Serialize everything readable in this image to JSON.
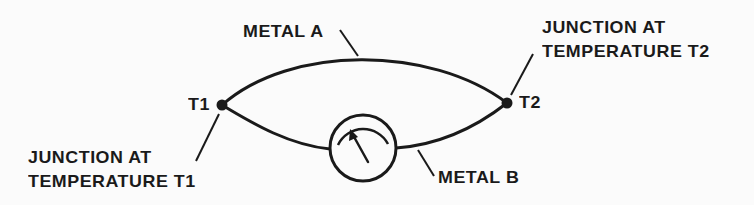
{
  "diagram": {
    "type": "thermocouple-circuit",
    "stroke_color": "#1a1a1a",
    "background_color": "#fbfbfb",
    "labels": {
      "metal_a": "METAL A",
      "metal_b": "METAL B",
      "t1": "T1",
      "t2": "T2",
      "junction_t1": {
        "line1": "JUNCTION AT",
        "line2": "TEMPERATURE T1"
      },
      "junction_t2": {
        "line1": "JUNCTION AT",
        "line2": "TEMPERATURE T2"
      }
    },
    "nodes": [
      {
        "id": "junction-t1",
        "label": "T1"
      },
      {
        "id": "junction-t2",
        "label": "T2"
      },
      {
        "id": "meter",
        "label": "galvanometer"
      }
    ],
    "edges": [
      {
        "from": "junction-t1",
        "to": "junction-t2",
        "label": "METAL A"
      },
      {
        "from": "junction-t1",
        "to": "meter",
        "label": "METAL B"
      },
      {
        "from": "meter",
        "to": "junction-t2",
        "label": "METAL B"
      }
    ]
  }
}
